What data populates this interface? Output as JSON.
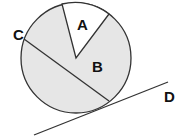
{
  "diagram": {
    "labels": {
      "a": "A",
      "b": "B",
      "c": "C",
      "d": "D"
    },
    "colors": {
      "shaded": "#e6e6e6",
      "unshaded": "#ffffff",
      "stroke": "#333333"
    },
    "circle": {
      "cx": 76,
      "cy": 58,
      "r": 55
    }
  }
}
